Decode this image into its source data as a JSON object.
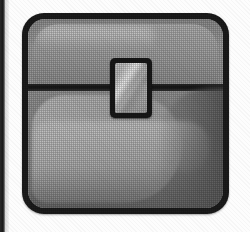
{
  "canvas": {
    "width": 250,
    "height": 232,
    "background_color": "#fdfdfd",
    "rendering": "halftone-dithered grayscale scan"
  },
  "page_artifact": {
    "name": "page-edge-stripe",
    "description": "dark scanned book gutter stripe along left edge",
    "color": "#1a1a1a",
    "width_px": 5
  },
  "icon": {
    "name": "treasure-chest-icon",
    "alt_text": "Treasure chest",
    "style": "grayscale halftone game icon",
    "frame": {
      "x": 22,
      "y": 13,
      "width": 207,
      "height": 201,
      "corner_radius_px": 22,
      "border_color": "#1d1d1d",
      "border_width_px": 6
    },
    "palette": {
      "outline": "#1d1d1d",
      "lid_base": "#a0a0a0",
      "lid_panel": "#b2b2b2",
      "body_base": "#8b8b8b",
      "body_highlight": "#bdbdbd",
      "body_shadow": "#5c5c5c",
      "seam": "#161616",
      "clasp_border": "#191919",
      "clasp_face": "#c2c2c2",
      "clasp_shine": "#fafafa",
      "page_background": "#fdfdfd"
    },
    "parts": [
      {
        "name": "lid",
        "label": "Chest lid",
        "top_px": 0,
        "height_px": 66
      },
      {
        "name": "seam",
        "label": "Lid seam",
        "top_px": 65,
        "height_px": 7
      },
      {
        "name": "body",
        "label": "Chest body",
        "top_px": 72,
        "height_px": 123
      },
      {
        "name": "clasp",
        "label": "Latch clasp",
        "x_px": 82,
        "y_px": 39,
        "width_px": 42,
        "height_px": 60
      }
    ]
  }
}
